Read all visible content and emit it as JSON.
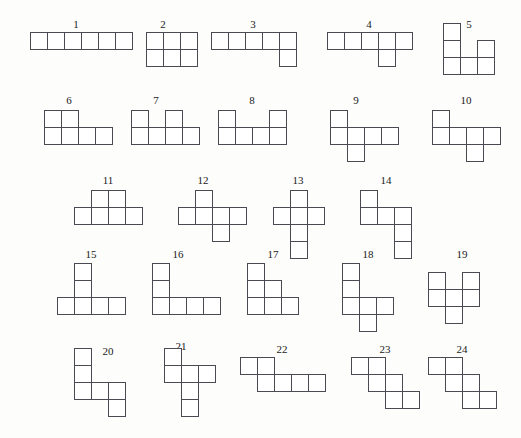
{
  "figure": {
    "title": "",
    "cell_size": 17,
    "stroke_color": "#4a4a52",
    "fill_color": "#ffffff",
    "background_color": "#fdfdfc",
    "label_color": "#1a1a1a",
    "shape_count": 24,
    "cells_per_shape": 6,
    "shapes": [
      {
        "id": 1,
        "label": "1",
        "origin": [
          30,
          32
        ],
        "label_pos": [
          76,
          19
        ],
        "cells": [
          [
            0,
            0
          ],
          [
            1,
            0
          ],
          [
            2,
            0
          ],
          [
            3,
            0
          ],
          [
            4,
            0
          ],
          [
            5,
            0
          ]
        ]
      },
      {
        "id": 2,
        "label": "2",
        "origin": [
          146,
          32
        ],
        "label_pos": [
          163,
          19
        ],
        "cells": [
          [
            0,
            0
          ],
          [
            1,
            0
          ],
          [
            2,
            0
          ],
          [
            0,
            1
          ],
          [
            1,
            1
          ],
          [
            2,
            1
          ]
        ]
      },
      {
        "id": 3,
        "label": "3",
        "origin": [
          211,
          32
        ],
        "label_pos": [
          253,
          19
        ],
        "cells": [
          [
            0,
            0
          ],
          [
            1,
            0
          ],
          [
            2,
            0
          ],
          [
            3,
            0
          ],
          [
            4,
            0
          ],
          [
            4,
            1
          ]
        ]
      },
      {
        "id": 4,
        "label": "4",
        "origin": [
          327,
          32
        ],
        "label_pos": [
          369,
          19
        ],
        "cells": [
          [
            0,
            0
          ],
          [
            1,
            0
          ],
          [
            2,
            0
          ],
          [
            3,
            0
          ],
          [
            4,
            0
          ],
          [
            3,
            1
          ]
        ]
      },
      {
        "id": 5,
        "label": "5",
        "origin": [
          443,
          23
        ],
        "label_pos": [
          469,
          19
        ],
        "cells": [
          [
            0,
            0
          ],
          [
            0,
            1
          ],
          [
            2,
            1
          ],
          [
            0,
            2
          ],
          [
            1,
            2
          ],
          [
            2,
            2
          ]
        ]
      },
      {
        "id": 6,
        "label": "6",
        "origin": [
          44,
          110
        ],
        "label_pos": [
          69,
          95
        ],
        "cells": [
          [
            0,
            0
          ],
          [
            1,
            0
          ],
          [
            0,
            1
          ],
          [
            1,
            1
          ],
          [
            2,
            1
          ],
          [
            3,
            1
          ]
        ]
      },
      {
        "id": 7,
        "label": "7",
        "origin": [
          131,
          110
        ],
        "label_pos": [
          156,
          95
        ],
        "cells": [
          [
            0,
            0
          ],
          [
            2,
            0
          ],
          [
            0,
            1
          ],
          [
            1,
            1
          ],
          [
            2,
            1
          ],
          [
            3,
            1
          ]
        ]
      },
      {
        "id": 8,
        "label": "8",
        "origin": [
          218,
          110
        ],
        "label_pos": [
          252,
          95
        ],
        "cells": [
          [
            0,
            0
          ],
          [
            3,
            0
          ],
          [
            0,
            1
          ],
          [
            1,
            1
          ],
          [
            2,
            1
          ],
          [
            3,
            1
          ]
        ]
      },
      {
        "id": 9,
        "label": "9",
        "origin": [
          330,
          110
        ],
        "label_pos": [
          356,
          95
        ],
        "cells": [
          [
            0,
            0
          ],
          [
            0,
            1
          ],
          [
            1,
            1
          ],
          [
            2,
            1
          ],
          [
            3,
            1
          ],
          [
            1,
            2
          ]
        ]
      },
      {
        "id": 10,
        "label": "10",
        "origin": [
          432,
          110
        ],
        "label_pos": [
          466,
          95
        ],
        "cells": [
          [
            0,
            0
          ],
          [
            0,
            1
          ],
          [
            1,
            1
          ],
          [
            2,
            1
          ],
          [
            3,
            1
          ],
          [
            2,
            2
          ]
        ]
      },
      {
        "id": 11,
        "label": "11",
        "origin": [
          74,
          190
        ],
        "label_pos": [
          108,
          175
        ],
        "cells": [
          [
            1,
            0
          ],
          [
            2,
            0
          ],
          [
            0,
            1
          ],
          [
            1,
            1
          ],
          [
            2,
            1
          ],
          [
            3,
            1
          ]
        ]
      },
      {
        "id": 12,
        "label": "12",
        "origin": [
          178,
          190
        ],
        "label_pos": [
          203,
          175
        ],
        "cells": [
          [
            1,
            0
          ],
          [
            0,
            1
          ],
          [
            1,
            1
          ],
          [
            2,
            1
          ],
          [
            3,
            1
          ],
          [
            2,
            2
          ]
        ]
      },
      {
        "id": 13,
        "label": "13",
        "origin": [
          273,
          190
        ],
        "label_pos": [
          298,
          175
        ],
        "cells": [
          [
            1,
            0
          ],
          [
            0,
            1
          ],
          [
            1,
            1
          ],
          [
            2,
            1
          ],
          [
            1,
            2
          ],
          [
            1,
            3
          ]
        ]
      },
      {
        "id": 14,
        "label": "14",
        "origin": [
          360,
          190
        ],
        "label_pos": [
          386,
          175
        ],
        "cells": [
          [
            0,
            0
          ],
          [
            0,
            1
          ],
          [
            1,
            1
          ],
          [
            2,
            1
          ],
          [
            2,
            2
          ],
          [
            2,
            3
          ]
        ]
      },
      {
        "id": 15,
        "label": "15",
        "origin": [
          57,
          263
        ],
        "label_pos": [
          91,
          249
        ],
        "cells": [
          [
            1,
            0
          ],
          [
            1,
            1
          ],
          [
            0,
            2
          ],
          [
            1,
            2
          ],
          [
            2,
            2
          ],
          [
            3,
            2
          ]
        ]
      },
      {
        "id": 16,
        "label": "16",
        "origin": [
          152,
          263
        ],
        "label_pos": [
          178,
          249
        ],
        "cells": [
          [
            0,
            0
          ],
          [
            0,
            1
          ],
          [
            0,
            2
          ],
          [
            1,
            2
          ],
          [
            2,
            2
          ],
          [
            3,
            2
          ]
        ]
      },
      {
        "id": 17,
        "label": "17",
        "origin": [
          247,
          263
        ],
        "label_pos": [
          273,
          249
        ],
        "cells": [
          [
            0,
            0
          ],
          [
            0,
            1
          ],
          [
            1,
            1
          ],
          [
            0,
            2
          ],
          [
            1,
            2
          ],
          [
            2,
            2
          ]
        ]
      },
      {
        "id": 18,
        "label": "18",
        "origin": [
          342,
          263
        ],
        "label_pos": [
          368,
          249
        ],
        "cells": [
          [
            0,
            0
          ],
          [
            0,
            1
          ],
          [
            0,
            2
          ],
          [
            1,
            2
          ],
          [
            2,
            2
          ],
          [
            1,
            3
          ]
        ]
      },
      {
        "id": 19,
        "label": "19",
        "origin": [
          428,
          272
        ],
        "label_pos": [
          462,
          249
        ],
        "cells": [
          [
            0,
            0
          ],
          [
            2,
            0
          ],
          [
            0,
            1
          ],
          [
            1,
            1
          ],
          [
            2,
            1
          ],
          [
            1,
            2
          ]
        ]
      },
      {
        "id": 20,
        "label": "20",
        "origin": [
          74,
          348
        ],
        "label_pos": [
          108,
          346
        ],
        "cells": [
          [
            0,
            0
          ],
          [
            0,
            1
          ],
          [
            0,
            2
          ],
          [
            1,
            2
          ],
          [
            2,
            2
          ],
          [
            2,
            3
          ]
        ]
      },
      {
        "id": 21,
        "label": "21",
        "origin": [
          164,
          348
        ],
        "label_pos": [
          181,
          341
        ],
        "cells": [
          [
            0,
            0
          ],
          [
            0,
            1
          ],
          [
            1,
            1
          ],
          [
            2,
            1
          ],
          [
            1,
            2
          ],
          [
            1,
            3
          ]
        ]
      },
      {
        "id": 22,
        "label": "22",
        "origin": [
          240,
          357
        ],
        "label_pos": [
          282,
          344
        ],
        "cells": [
          [
            0,
            0
          ],
          [
            1,
            0
          ],
          [
            1,
            1
          ],
          [
            2,
            1
          ],
          [
            3,
            1
          ],
          [
            4,
            1
          ]
        ]
      },
      {
        "id": 23,
        "label": "23",
        "origin": [
          351,
          357
        ],
        "label_pos": [
          385,
          344
        ],
        "cells": [
          [
            0,
            0
          ],
          [
            1,
            0
          ],
          [
            1,
            1
          ],
          [
            2,
            1
          ],
          [
            2,
            2
          ],
          [
            3,
            2
          ]
        ]
      },
      {
        "id": 24,
        "label": "24",
        "origin": [
          428,
          357
        ],
        "label_pos": [
          462,
          344
        ],
        "cells": [
          [
            0,
            0
          ],
          [
            1,
            0
          ],
          [
            1,
            1
          ],
          [
            2,
            1
          ],
          [
            2,
            2
          ],
          [
            3,
            2
          ]
        ]
      }
    ]
  }
}
